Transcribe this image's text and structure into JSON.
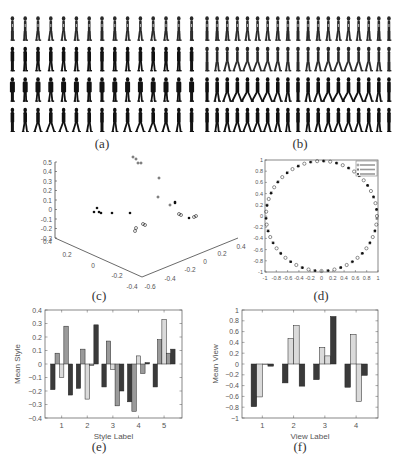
{
  "figure": {
    "captions": {
      "a": "(a)",
      "b": "(b)",
      "c": "(c)",
      "d": "(d)",
      "e": "(e)",
      "f": "(f)"
    }
  },
  "gait_panels": {
    "a": {
      "rows": 4,
      "cols": 15,
      "row_styles": [
        "thin",
        "dark",
        "wide",
        "dark-walk"
      ]
    },
    "b": {
      "rows": 4,
      "cols": 19,
      "row_styles": [
        "thin",
        "thin-walk",
        "wide-stride",
        "dark-walk"
      ]
    }
  },
  "chart_data": [
    {
      "id": "c",
      "type": "scatter",
      "title": "",
      "projection": "3d",
      "z_ticks": [
        "0.5",
        "0.4",
        "0.3",
        "0.2",
        "0.1",
        "0",
        "-0.1",
        "-0.2",
        "-0.3"
      ],
      "x_ticks": [
        "0.4",
        "0.2",
        "0",
        "-0.2",
        "-0.4"
      ],
      "y_ticks": [
        "-0.6",
        "-0.4",
        "-0.2",
        "0",
        "0.2",
        "0.4"
      ],
      "markers": [
        "+",
        "*",
        "o"
      ],
      "points_screen": [
        [
          133,
          157,
          "+"
        ],
        [
          136,
          159,
          "+"
        ],
        [
          138,
          163,
          "+"
        ],
        [
          141,
          163,
          "+"
        ],
        [
          159,
          178,
          "+"
        ],
        [
          158,
          197,
          "+"
        ],
        [
          170,
          205,
          "+"
        ],
        [
          175,
          203,
          "*"
        ],
        [
          175,
          202,
          "*"
        ],
        [
          97,
          208,
          "*"
        ],
        [
          99,
          212,
          "*"
        ],
        [
          94,
          212,
          "*"
        ],
        [
          101,
          213,
          "*"
        ],
        [
          112,
          213,
          "*"
        ],
        [
          130,
          213,
          "*"
        ],
        [
          179,
          214,
          "o"
        ],
        [
          181,
          215,
          "o"
        ],
        [
          189,
          218,
          "*"
        ],
        [
          194,
          217,
          "o"
        ],
        [
          196,
          216,
          "o"
        ],
        [
          143,
          224,
          "o"
        ],
        [
          145,
          225,
          "o"
        ],
        [
          136,
          228,
          "o"
        ],
        [
          135,
          231,
          "o"
        ]
      ]
    },
    {
      "id": "d",
      "type": "scatter",
      "title": "",
      "xlim": [
        -1,
        1
      ],
      "ylim": [
        -1,
        1
      ],
      "x_ticks": [
        "-1",
        "-0.8",
        "-0.6",
        "-0.4",
        "-0.2",
        "0",
        "0.2",
        "0.4",
        "0.6",
        "0.8",
        "1"
      ],
      "y_ticks": [
        "1",
        "0.8",
        "0.6",
        "0.4",
        "0.2",
        "0",
        "-0.2",
        "-0.4",
        "-0.6",
        "-0.8",
        "-1"
      ],
      "description": "points lie on the unit circle",
      "legend": {
        "position": "upper right",
        "entries": [
          "series 1",
          "series 2",
          "series 3"
        ],
        "markers": [
          "o",
          "s",
          "*"
        ]
      },
      "series_angles_deg": [
        0,
        10,
        20,
        35,
        50,
        60,
        75,
        88,
        100,
        115,
        130,
        140,
        155,
        170,
        180,
        195,
        205,
        215,
        225,
        240,
        255,
        265,
        275,
        290,
        300,
        315,
        325,
        335,
        345,
        355
      ]
    },
    {
      "id": "e",
      "type": "bar",
      "title": "",
      "xlabel": "Style Label",
      "ylabel": "Mean Style",
      "ylim": [
        -0.4,
        0.4
      ],
      "y_ticks": [
        "0.4",
        "0.3",
        "0.2",
        "0.1",
        "0",
        "-0.1",
        "-0.2",
        "-0.3",
        "-0.4"
      ],
      "categories": [
        "1",
        "2",
        "3",
        "4",
        "5"
      ],
      "series": [
        {
          "name": "dim 1",
          "color": "#3a3a3a",
          "values": [
            -0.19,
            -0.18,
            -0.17,
            -0.28,
            -0.17
          ]
        },
        {
          "name": "dim 2",
          "color": "#9a9a9a",
          "values": [
            0.08,
            0.11,
            0.17,
            -0.35,
            0.18
          ]
        },
        {
          "name": "dim 3",
          "color": "#dadada",
          "values": [
            -0.1,
            -0.26,
            -0.04,
            0.06,
            0.33
          ]
        },
        {
          "name": "dim 4",
          "color": "#9a9a9a",
          "values": [
            0.28,
            -0.01,
            -0.31,
            -0.07,
            0.08
          ]
        },
        {
          "name": "dim 5",
          "color": "#3a3a3a",
          "values": [
            -0.23,
            0.29,
            -0.2,
            0.01,
            0.11
          ]
        }
      ]
    },
    {
      "id": "f",
      "type": "bar",
      "title": "",
      "xlabel": "View Label",
      "ylabel": "Mean View",
      "ylim": [
        -1,
        1
      ],
      "y_ticks": [
        "1",
        "0.8",
        "0.6",
        "0.4",
        "0.2",
        "0",
        "-0.2",
        "-0.4",
        "-0.6",
        "-0.8",
        "-1"
      ],
      "categories": [
        "1",
        "2",
        "3",
        "4"
      ],
      "series": [
        {
          "name": "dim 1",
          "color": "#3a3a3a",
          "values": [
            -0.79,
            -0.35,
            -0.29,
            -0.43
          ]
        },
        {
          "name": "dim 2",
          "color": "#dadada",
          "values": [
            -0.61,
            0.47,
            0.31,
            0.55
          ]
        },
        {
          "name": "dim 3",
          "color": "#dadada",
          "values": [
            0.0,
            0.71,
            0.15,
            -0.69
          ]
        },
        {
          "name": "dim 4",
          "color": "#3a3a3a",
          "values": [
            -0.04,
            -0.41,
            0.88,
            -0.21
          ]
        }
      ]
    }
  ]
}
